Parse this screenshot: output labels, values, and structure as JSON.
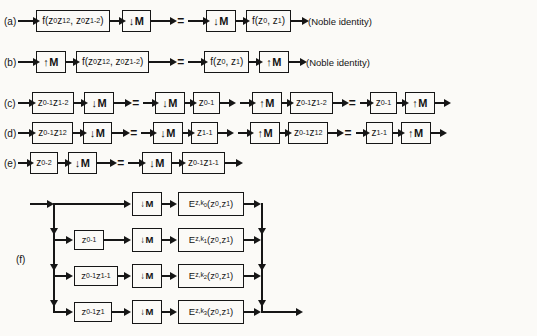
{
  "labels": {
    "a": "(a)",
    "b": "(b)",
    "c": "(c)",
    "d": "(d)",
    "e": "(e)",
    "f": "(f)"
  },
  "symbols": {
    "equals": "="
  },
  "notes": {
    "noble": "(Noble identity)"
  },
  "blocks": {
    "down_m": "↓M",
    "up_m": "↑M",
    "f_full": "f(z_{0}z_{1}^{2}, z_{0}z_{1}^{-2})",
    "f_simple": "f(z_{0}, z_{1})",
    "z0m1_z1m2": "z_{0}^{-1}z_{1}^{-2}",
    "z0m1": "z_{0}^{-1}",
    "z0m1_z1p2": "z_{0}^{-1}z_{1}^{2}",
    "z1m1": "z_{1}^{-1}",
    "z0m2": "z_{0}^{-2}",
    "z0m1_z1m1": "z_{0}^{-1}z_{1}^{-1}",
    "z0m1_z1": "z_{0}^{-1}z_{1}",
    "e_k0": "E_{z,k_{0}}(z_{0},z_{1})",
    "e_k1": "E_{z,k_{1}}(z_{0},z_{1})",
    "e_k2": "E_{z,k_{2}}(z_{0},z_{1})",
    "e_k3": "E_{z,k_{3}}(z_{0},z_{1})"
  }
}
